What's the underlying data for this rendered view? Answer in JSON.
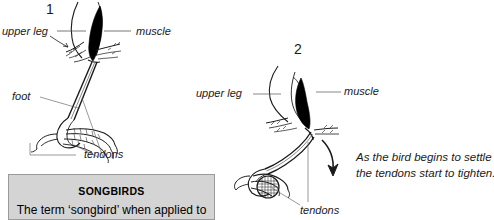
{
  "figure": {
    "type": "anatomical-diagram",
    "panels": [
      {
        "number": "1",
        "labels": [
          {
            "name": "upper-leg",
            "text": "upper leg"
          },
          {
            "name": "muscle",
            "text": "muscle"
          },
          {
            "name": "foot",
            "text": "foot"
          },
          {
            "name": "tendons",
            "text": "tendons"
          }
        ]
      },
      {
        "number": "2",
        "labels": [
          {
            "name": "upper-leg",
            "text": "upper leg"
          },
          {
            "name": "muscle",
            "text": "muscle"
          },
          {
            "name": "tendons",
            "text": "tendons"
          }
        ],
        "annotation_line_1": "As the bird begins to settle",
        "annotation_line_2": "the tendons start to tighten."
      }
    ]
  },
  "callout": {
    "title": "SONGBIRDS",
    "body": "The term ‘songbird’ when applied to",
    "background_color": "#d4d4d4",
    "border_color": "#9a9a9a"
  },
  "colors": {
    "ink": "#1a1a1a",
    "muscle_fill": "#000000",
    "leader_line": "#555555",
    "page_background": "#ffffff"
  }
}
